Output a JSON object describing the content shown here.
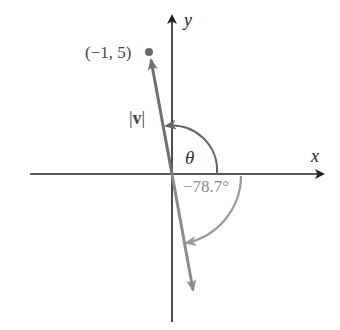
{
  "diagram": {
    "type": "vector-angle-diagram",
    "axes": {
      "x_label": "x",
      "y_label": "y"
    },
    "labels": {
      "point": "(−1, 5)",
      "magnitude_bar_left": "|",
      "magnitude_symbol": "v",
      "magnitude_bar_right": "|",
      "theta": "θ",
      "negative_angle": "−78.7°"
    },
    "vectors": [
      {
        "name": "v",
        "tip": [
          -1,
          5
        ],
        "color": "#707070"
      },
      {
        "name": "reflected",
        "direction_deg": -78.7,
        "color": "#8c8c8c"
      }
    ],
    "arcs": [
      {
        "name": "theta-arc",
        "color": "#666666"
      },
      {
        "name": "negative-angle-arc",
        "angle_deg": -78.7,
        "color": "#9a9a9a"
      }
    ],
    "colors": {
      "axis": "#222222",
      "vector": "#707070",
      "theta_arc": "#666666",
      "negative_arc": "#9a9a9a",
      "point": "#6a6a6a"
    }
  }
}
